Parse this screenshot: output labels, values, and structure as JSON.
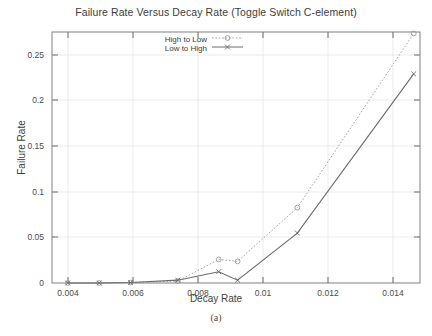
{
  "figure": {
    "caption": "(a)"
  },
  "chart_data": {
    "type": "line",
    "title": "Failure Rate Versus Decay Rate (Toggle Switch C-element)",
    "xlabel": "Decay Rate",
    "ylabel": "Failure Rate",
    "xlim": [
      0.0035,
      0.0152
    ],
    "ylim": [
      0,
      0.2665
    ],
    "xticks": [
      0.004,
      0.006,
      0.008,
      0.01,
      0.012,
      0.014
    ],
    "xtick_labels": [
      "0.004",
      "0.006",
      "0.008",
      "0.01",
      "0.012",
      "0.014"
    ],
    "yticks": [
      0,
      0.05,
      0.1,
      0.15,
      0.2,
      0.25
    ],
    "ytick_labels": [
      "0",
      "0.05",
      "0.1",
      "0.15",
      "0.2",
      "0.25"
    ],
    "grid": true,
    "legend_position": "top-center-inside",
    "series": [
      {
        "name": "High to Low",
        "marker": "circle",
        "linestyle": "dotted",
        "color": "#999999",
        "x": [
          0.004,
          0.005,
          0.006,
          0.0075,
          0.0088,
          0.0094,
          0.0113,
          0.015
        ],
        "values": [
          0.0,
          0.0,
          0.0005,
          0.002,
          0.025,
          0.023,
          0.08,
          0.265
        ]
      },
      {
        "name": "Low to High",
        "marker": "x",
        "linestyle": "solid",
        "color": "#6b6b6b",
        "x": [
          0.004,
          0.005,
          0.006,
          0.0075,
          0.0088,
          0.0094,
          0.0113,
          0.015
        ],
        "values": [
          0.0,
          0.0,
          0.0005,
          0.003,
          0.012,
          0.003,
          0.053,
          0.222
        ]
      }
    ]
  }
}
